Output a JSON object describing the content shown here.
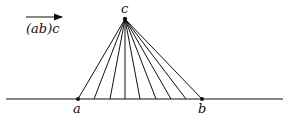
{
  "diagram": {
    "arrow_label": "(ab)c",
    "apex": {
      "label": "c",
      "x": 125,
      "y": 19
    },
    "baseline": {
      "x1": 6,
      "x2": 283,
      "y": 99
    },
    "point_a": {
      "label": "a",
      "x": 78
    },
    "point_b": {
      "label": "b",
      "x": 202
    },
    "ray_endpoints_x": [
      78,
      94,
      110,
      125,
      140,
      156,
      171,
      186,
      202
    ],
    "colors": {
      "ink": "#111111",
      "background": "#ffffff"
    }
  }
}
